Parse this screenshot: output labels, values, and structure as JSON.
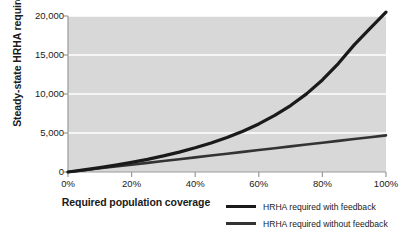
{
  "chart_data": {
    "type": "line",
    "title": "",
    "xlabel": "Required population coverage",
    "ylabel": "Steady-state HRHA required",
    "xlim": [
      0,
      100
    ],
    "ylim": [
      0,
      20000
    ],
    "grid": true,
    "legend_position": "bottom-right",
    "xticks": [
      "0%",
      "20%",
      "40%",
      "60%",
      "80%",
      "100%"
    ],
    "xtick_values": [
      0,
      20,
      40,
      60,
      80,
      100
    ],
    "yticks": [
      "0",
      "5,000",
      "10,000",
      "15,000",
      "20,000"
    ],
    "ytick_values": [
      0,
      5000,
      10000,
      15000,
      20000
    ],
    "x": [
      0,
      5,
      10,
      15,
      20,
      25,
      30,
      35,
      40,
      45,
      50,
      55,
      60,
      65,
      70,
      75,
      80,
      85,
      90,
      95,
      100
    ],
    "series": [
      {
        "name": "HRHA required with feedback",
        "color": "#1a1a1a",
        "width": 3.2,
        "values": [
          0,
          270,
          560,
          880,
          1230,
          1620,
          2060,
          2550,
          3100,
          3720,
          4420,
          5230,
          6160,
          7250,
          8520,
          10020,
          11800,
          13900,
          16300,
          18400,
          20500
        ]
      },
      {
        "name": "HRHA required without feedback",
        "color": "#333333",
        "width": 2.6,
        "values": [
          0,
          235,
          470,
          705,
          940,
          1175,
          1410,
          1645,
          1880,
          2115,
          2350,
          2585,
          2820,
          3055,
          3290,
          3525,
          3760,
          3995,
          4230,
          4465,
          4700
        ]
      }
    ]
  },
  "legend": {
    "items": [
      {
        "label": "HRHA required with feedback"
      },
      {
        "label": "HRHA required without feedback"
      }
    ]
  }
}
